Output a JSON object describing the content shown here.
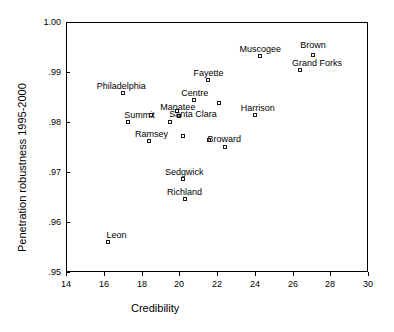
{
  "chart_data": {
    "type": "scatter",
    "title": "",
    "xlabel": "Credibility",
    "ylabel": "Penetration robustness 1995-2000",
    "xlim": [
      14,
      30
    ],
    "ylim": [
      0.95,
      1.0
    ],
    "xticks": [
      14,
      16,
      18,
      20,
      22,
      24,
      26,
      28,
      30
    ],
    "xtick_labels": [
      "14",
      "16",
      "18",
      "20",
      "22",
      "24",
      "26",
      "28",
      "30"
    ],
    "yticks": [
      0.95,
      0.96,
      0.97,
      0.98,
      0.99,
      1.0
    ],
    "ytick_labels": [
      ".95",
      ".96",
      ".97",
      ".98",
      ".99",
      "1.00"
    ],
    "grid": false,
    "legend": false,
    "marker": "open-square",
    "marker_color": "#1a1a1a",
    "points": [
      {
        "label": "Leon",
        "x": 16.2,
        "y": 0.956,
        "label_dx": -1,
        "label_dy": -12
      },
      {
        "label": "Philadelphia",
        "x": 17.0,
        "y": 0.9859,
        "label_dx": -26,
        "label_dy": -12
      },
      {
        "label": "Summit",
        "x": 17.3,
        "y": 0.98,
        "label_dx": -4,
        "label_dy": -12
      },
      {
        "label": "",
        "x": 18.5,
        "y": 0.9815,
        "label_dx": 0,
        "label_dy": 0
      },
      {
        "label": "Ramsey",
        "x": 18.4,
        "y": 0.9763,
        "label_dx": -14,
        "label_dy": -12
      },
      {
        "label": "",
        "x": 19.5,
        "y": 0.98,
        "label_dx": 0,
        "label_dy": 0
      },
      {
        "label": "Manatee",
        "x": 19.9,
        "y": 0.9823,
        "label_dx": -17,
        "label_dy": -9
      },
      {
        "label": "Santa Clara",
        "x": 20.0,
        "y": 0.9812,
        "label_dx": -10,
        "label_dy": -7
      },
      {
        "label": "",
        "x": 20.2,
        "y": 0.9773,
        "label_dx": 0,
        "label_dy": 0
      },
      {
        "label": "Sedgwick",
        "x": 20.2,
        "y": 0.9686,
        "label_dx": -18,
        "label_dy": -12
      },
      {
        "label": "Richland",
        "x": 20.3,
        "y": 0.9647,
        "label_dx": -18,
        "label_dy": -12
      },
      {
        "label": "Centre",
        "x": 20.8,
        "y": 0.9845,
        "label_dx": -13,
        "label_dy": -12
      },
      {
        "label": "Fayette",
        "x": 21.5,
        "y": 0.9885,
        "label_dx": -14,
        "label_dy": -12
      },
      {
        "label": "",
        "x": 22.1,
        "y": 0.9838,
        "label_dx": 0,
        "label_dy": 0
      },
      {
        "label": "Broward",
        "x": 21.6,
        "y": 0.9765,
        "label_dx": -2,
        "label_dy": -6
      },
      {
        "label": "",
        "x": 22.4,
        "y": 0.975,
        "label_dx": 0,
        "label_dy": 0
      },
      {
        "label": "Harrison",
        "x": 24.0,
        "y": 0.9815,
        "label_dx": -14,
        "label_dy": -12
      },
      {
        "label": "Muscogee",
        "x": 24.3,
        "y": 0.9932,
        "label_dx": -21,
        "label_dy": -12
      },
      {
        "label": "Grand Forks",
        "x": 26.4,
        "y": 0.9905,
        "label_dx": -8,
        "label_dy": -12
      },
      {
        "label": "Brown",
        "x": 27.1,
        "y": 0.9935,
        "label_dx": -13,
        "label_dy": -15
      }
    ]
  }
}
